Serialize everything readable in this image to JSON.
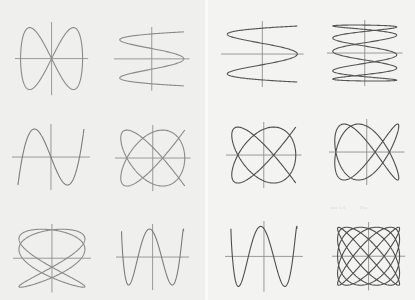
{
  "pages": [
    {
      "side": "left",
      "figures": [
        {
          "id": "L1",
          "cx": 52,
          "cy": 59,
          "w": 62,
          "h": 62,
          "ax": 1,
          "ay": 2,
          "phase": 0,
          "open": false,
          "stroke": "#8a8a88"
        },
        {
          "id": "L2",
          "cx": 152,
          "cy": 59,
          "w": 64,
          "h": 54,
          "ax": 4,
          "ay": 1,
          "phase": 0.5,
          "open": false,
          "stroke": "#8a8a88"
        },
        {
          "id": "L3",
          "cx": 51,
          "cy": 157,
          "w": 66,
          "h": 56,
          "ax": 1,
          "ay": 3,
          "phase": 0,
          "open": true,
          "stroke": "#7c7c7a"
        },
        {
          "id": "L4",
          "cx": 153,
          "cy": 158,
          "w": 64,
          "h": 56,
          "ax": 4,
          "ay": 5,
          "phase": 0.5,
          "open": false,
          "stroke": "#8a8a88"
        },
        {
          "id": "L5",
          "cx": 52,
          "cy": 258,
          "w": 66,
          "h": 58,
          "ax": 3,
          "ay": 2,
          "phase": 0.35,
          "open": false,
          "stroke": "#8a8a88"
        },
        {
          "id": "L6",
          "cx": 153,
          "cy": 257,
          "w": 62,
          "h": 56,
          "ax": 1,
          "ay": 4,
          "phase": 0,
          "open": true,
          "stroke": "#7c7c7a"
        }
      ]
    },
    {
      "side": "right",
      "figures": [
        {
          "id": "R1",
          "cx": 262,
          "cy": 54,
          "w": 70,
          "h": 56,
          "ax": 4,
          "ay": 1,
          "phase": 0.5,
          "open": false,
          "stroke": "#555553"
        },
        {
          "id": "R2",
          "cx": 365,
          "cy": 53,
          "w": 64,
          "h": 56,
          "ax": 5,
          "ay": 1,
          "phase": 0.6,
          "open": false,
          "stroke": "#555553"
        },
        {
          "id": "R3",
          "cx": 264,
          "cy": 155,
          "w": 64,
          "h": 56,
          "ax": 4,
          "ay": 5,
          "phase": 0.5,
          "open": false,
          "stroke": "#4e4e4c"
        },
        {
          "id": "R4",
          "cx": 367,
          "cy": 152,
          "w": 64,
          "h": 56,
          "ax": 2,
          "ay": 3,
          "phase": 0.25,
          "open": false,
          "stroke": "#4e4e4c"
        },
        {
          "id": "R5",
          "cx": 264,
          "cy": 256,
          "w": 66,
          "h": 60,
          "ax": 1,
          "ay": 4,
          "phase": 0,
          "open": true,
          "stroke": "#4e4e4c"
        },
        {
          "id": "R6",
          "cx": 369,
          "cy": 256,
          "w": 62,
          "h": 58,
          "ax": 5,
          "ay": 6,
          "phase": 0.5,
          "open": false,
          "stroke": "#4e4e4c"
        }
      ]
    }
  ],
  "axes": {
    "color": "#8e8e8c",
    "extend": 1.18
  },
  "bleed_text": [
    "ctor 1.0",
    "Exe"
  ]
}
